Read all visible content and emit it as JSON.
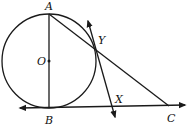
{
  "diagram": {
    "colors": {
      "stroke": "#1a1a1a",
      "background": "#ffffff"
    },
    "labels": {
      "A": "A",
      "O": "O",
      "B": "B",
      "Y": "Y",
      "X": "X",
      "C": "C"
    },
    "circle": {
      "center": "O",
      "cx": 49,
      "cy": 61,
      "r": 47
    },
    "points": {
      "A": [
        49,
        14
      ],
      "O": [
        49,
        61
      ],
      "B": [
        49,
        108
      ],
      "Y": [
        94,
        47
      ],
      "X": [
        110,
        107
      ],
      "C": [
        169,
        106
      ]
    },
    "segments": [
      "AB (diameter)",
      "AC",
      "line through Y and X (tangent at Y)",
      "line through B and C (tangent at B)"
    ]
  }
}
